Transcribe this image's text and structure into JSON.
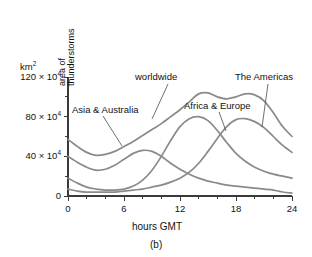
{
  "caption": "(b)",
  "axes": {
    "y_unit": "km2",
    "y_unit_base": "km",
    "y_unit_sup": "2",
    "y_title_line1": "area of",
    "y_title_line2": "thunderstorms",
    "x_title": "hours GMT",
    "y_ticks": [
      {
        "value": 0,
        "label": "0",
        "mantissa": "",
        "sup": ""
      },
      {
        "value": 400000,
        "label": "40 × 10",
        "mantissa": "40 × 10",
        "sup": "4"
      },
      {
        "value": 800000,
        "label": "80 × 10",
        "mantissa": "80 × 10",
        "sup": "4"
      },
      {
        "value": 1200000,
        "label": "120 × 10",
        "mantissa": "120 × 10",
        "sup": "4"
      }
    ],
    "x_ticks": [
      {
        "value": 0,
        "label": "0"
      },
      {
        "value": 6,
        "label": "6"
      },
      {
        "value": 12,
        "label": "12"
      },
      {
        "value": 18,
        "label": "18"
      },
      {
        "value": 24,
        "label": "24"
      }
    ],
    "x_minor_step": 2
  },
  "labels": [
    {
      "id": "worldwide",
      "text": "worldwide"
    },
    {
      "id": "asia-australia",
      "text": "Asia & Australia"
    },
    {
      "id": "africa-europe",
      "text": "Africa & Europe"
    },
    {
      "id": "the-americas",
      "text": "The Americas"
    }
  ],
  "colors": {
    "curve": "#8a8a8a",
    "axis": "#3a3a3a",
    "text": "#111111",
    "background": "#ffffff"
  },
  "chart_data": {
    "type": "line",
    "title": "",
    "subtitle": "",
    "xlabel": "hours GMT",
    "ylabel": "area of thunderstorms",
    "y_unit": "km^2",
    "y_scale_factor": 10000,
    "xlim": [
      0,
      24
    ],
    "ylim": [
      0,
      1200000
    ],
    "yticks": [
      0,
      400000,
      800000,
      1200000
    ],
    "ytick_labels": [
      "0",
      "40 × 10^4",
      "80 × 10^4",
      "120 × 10^4"
    ],
    "xticks": [
      0,
      6,
      12,
      18,
      24
    ],
    "xtick_labels": [
      "0",
      "6",
      "12",
      "18",
      "24"
    ],
    "grid": false,
    "legend": "inline-annotations",
    "x": [
      0,
      1,
      2,
      3,
      4,
      5,
      6,
      7,
      8,
      9,
      10,
      11,
      12,
      13,
      14,
      15,
      16,
      17,
      18,
      19,
      20,
      21,
      22,
      23,
      24
    ],
    "series": [
      {
        "name": "worldwide",
        "units": "10^4 km^2",
        "values": [
          57,
          50,
          44,
          41,
          42,
          45,
          50,
          55,
          61,
          67,
          73,
          80,
          87,
          95,
          103,
          104,
          100,
          98,
          100,
          103,
          102,
          96,
          84,
          70,
          60
        ]
      },
      {
        "name": "Asia & Australia",
        "units": "10^4 km^2",
        "values": [
          40,
          34,
          29,
          26,
          27,
          31,
          37,
          43,
          46,
          45,
          40,
          33,
          27,
          22,
          18,
          15,
          13,
          11,
          10,
          9,
          8,
          7,
          6,
          4,
          3
        ]
      },
      {
        "name": "Africa & Europe",
        "units": "10^4 km^2",
        "values": [
          18,
          13,
          9,
          7,
          6,
          6,
          7,
          10,
          16,
          26,
          40,
          56,
          70,
          78,
          80,
          76,
          66,
          54,
          43,
          35,
          29,
          25,
          22,
          20,
          18
        ]
      },
      {
        "name": "The Americas",
        "units": "10^4 km^2",
        "values": [
          7,
          5,
          4,
          4,
          4,
          4,
          5,
          6,
          7,
          9,
          11,
          14,
          18,
          24,
          33,
          45,
          58,
          70,
          77,
          78,
          75,
          69,
          60,
          51,
          44
        ]
      }
    ]
  }
}
